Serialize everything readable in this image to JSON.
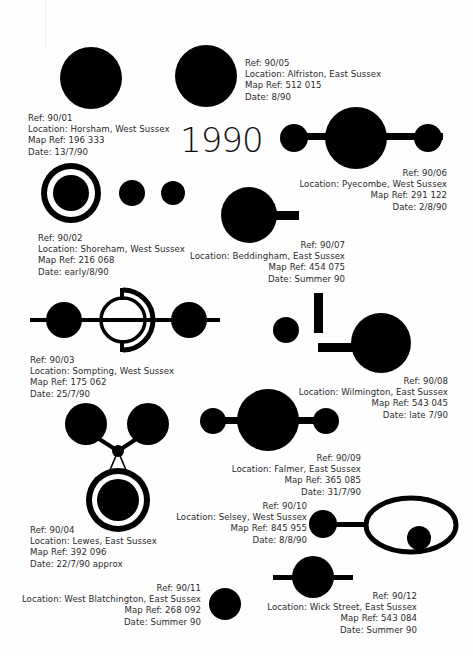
{
  "title": "1990",
  "entries": [
    {
      "ref": "Ref: 90/01",
      "location": "Location: Horsham, West Sussex",
      "map_ref": "Map Ref: 196 333",
      "date": "Date: 13/7/90"
    },
    {
      "ref": "Ref: 90/02",
      "location": "Location: Shoreham, West Sussex",
      "map_ref": "Map Ref: 216 068",
      "date": "Date: early/8/90"
    },
    {
      "ref": "Ref: 90/03",
      "location": "Location: Sompting, West Sussex",
      "map_ref": "Map Ref: 175 062",
      "date": "Date: 25/7/90"
    },
    {
      "ref": "Ref: 90/04",
      "location": "Location: Lewes, East Sussex",
      "map_ref": "Map Ref: 392 096",
      "date": "Date: 22/7/90 approx"
    },
    {
      "ref": "Ref: 90/05",
      "location": "Location: Alfriston, East Sussex",
      "map_ref": "Map Ref: 512 015",
      "date": "Date: 8/90"
    },
    {
      "ref": "Ref: 90/06",
      "location": "Location: Pyecombe, West Sussex",
      "map_ref": "Map Ref: 291 122",
      "date": "Date: 2/8/90"
    },
    {
      "ref": "Ref: 90/07",
      "location": "Location: Beddingham, East Sussex",
      "map_ref": "Map Ref: 454 075",
      "date": "Date: Summer 90"
    },
    {
      "ref": "Ref: 90/08",
      "location": "Location: Wilmington, East Sussex",
      "map_ref": "Map Ref: 543 045",
      "date": "Date: late 7/90"
    },
    {
      "ref": "Ref: 90/09",
      "location": "Location: Falmer, East Sussex",
      "map_ref": "Map Ref: 365 085",
      "date": "Date: 31/7/90"
    },
    {
      "ref": "Ref: 90/10",
      "location": "Location: Selsey, West Sussex",
      "map_ref": "Map Ref: 845 955",
      "date": "Date: 8/8/90"
    },
    {
      "ref": "Ref: 90/11",
      "location": "Location: West Blatchington, East Sussex",
      "map_ref": "Map Ref: 268 092",
      "date": "Date: Summer 90"
    },
    {
      "ref": "Ref: 90/12",
      "location": "Location: Wick Street, East Sussex",
      "map_ref": "Map Ref: 543 084",
      "date": "Date: Summer 90"
    }
  ],
  "colors": {
    "ink": "#000000",
    "paper": "#ffffff",
    "text": "#2a2a2a"
  }
}
